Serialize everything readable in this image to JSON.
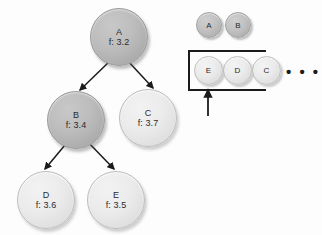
{
  "diagram": {
    "background_color": "#fdfdfd",
    "arrow_color": "#1b1b1b",
    "dark_node_color": "#b6b6b6",
    "light_node_color": "#e6e6e6"
  },
  "tree": {
    "nodes": [
      {
        "id": "A",
        "label": "A",
        "fvalue": "f: 3.2",
        "shade": "dark",
        "x": 90,
        "y": 8,
        "size": 58
      },
      {
        "id": "B",
        "label": "B",
        "fvalue": "f: 3.4",
        "shade": "dark",
        "x": 47,
        "y": 91,
        "size": 58
      },
      {
        "id": "C",
        "label": "C",
        "fvalue": "f: 3.7",
        "shade": "light",
        "x": 119,
        "y": 89,
        "size": 58
      },
      {
        "id": "D",
        "label": "D",
        "fvalue": "f: 3.6",
        "shade": "light",
        "x": 17,
        "y": 171,
        "size": 58
      },
      {
        "id": "E",
        "label": "E",
        "fvalue": "f: 3.5",
        "shade": "light",
        "x": 87,
        "y": 171,
        "size": 58
      }
    ],
    "edges": [
      {
        "from": "A",
        "to": "B"
      },
      {
        "from": "A",
        "to": "C"
      },
      {
        "from": "B",
        "to": "D"
      },
      {
        "from": "B",
        "to": "E"
      }
    ]
  },
  "queue": {
    "explored": [
      {
        "id": "A",
        "label": "A",
        "shade": "dark",
        "x": 196,
        "y": 12,
        "size": 26
      },
      {
        "id": "B",
        "label": "B",
        "shade": "dark",
        "x": 225,
        "y": 12,
        "size": 26
      }
    ],
    "frontier": [
      {
        "id": "E",
        "label": "E",
        "shade": "light",
        "x": 196,
        "y": 56,
        "size": 28
      },
      {
        "id": "D",
        "label": "D",
        "shade": "light",
        "x": 224,
        "y": 56,
        "size": 28
      },
      {
        "id": "C",
        "label": "C",
        "shade": "light",
        "x": 252,
        "y": 56,
        "size": 28
      }
    ],
    "ellipsis": "• • •",
    "box": {
      "x": 188,
      "y": 50,
      "width": 78,
      "height": 41
    },
    "pointer": {
      "x": 208,
      "y_top": 92,
      "y_bottom": 116
    }
  }
}
